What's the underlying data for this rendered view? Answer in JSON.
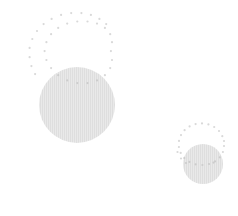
{
  "figure": {
    "width": 238,
    "height": 216,
    "background_color": "#ffffff"
  },
  "style": {
    "dot_color": "#d9d9d9",
    "dot_color_overlap": "#cccccc",
    "disc_fill_color": "#e6e6e6",
    "disc_hatch_color": "#dcdcdc",
    "dot_radius": 1.1,
    "hatch_spacing": 2,
    "hatch_width": 1
  },
  "chart_data": {
    "type": "scatter",
    "subtitle": "",
    "xlabel": "",
    "ylabel": "",
    "xlim": [
      0,
      238
    ],
    "ylim": [
      0,
      216
    ],
    "grid": false,
    "legend": "none",
    "axes_visible": false,
    "ticks_visible": false,
    "annotations": [],
    "series": [
      {
        "name": "large-dotted-ring",
        "shape": "circle-outline-dots",
        "marker": "dot",
        "center": [
          65,
          60
        ],
        "radius": 47,
        "point_count": 36,
        "color": "#d9d9d9",
        "points": [
          [
            112.0,
            60.0
          ],
          [
            110.2,
            68.1
          ],
          [
            104.9,
            75.2
          ],
          [
            97.0,
            80.4
          ],
          [
            87.5,
            83.1
          ],
          [
            77.3,
            83.1
          ],
          [
            67.2,
            80.4
          ],
          [
            58.2,
            75.2
          ],
          [
            51.1,
            68.1
          ],
          [
            46.4,
            60.0
          ],
          [
            44.6,
            51.1
          ],
          [
            46.4,
            42.2
          ],
          [
            51.1,
            34.2
          ],
          [
            58.2,
            27.9
          ],
          [
            67.2,
            23.6
          ],
          [
            77.3,
            21.5
          ],
          [
            87.5,
            21.5
          ],
          [
            97.0,
            23.6
          ],
          [
            104.9,
            27.9
          ],
          [
            110.2,
            34.2
          ],
          [
            112.0,
            42.2
          ],
          [
            110.9,
            51.1
          ],
          [
            106.2,
            24.1
          ],
          [
            99.4,
            18.9
          ],
          [
            90.9,
            14.9
          ],
          [
            81.4,
            13.1
          ],
          [
            71.2,
            13.1
          ],
          [
            61.1,
            14.9
          ],
          [
            51.6,
            18.9
          ],
          [
            43.6,
            24.1
          ],
          [
            37.0,
            31.0
          ],
          [
            32.3,
            39.0
          ],
          [
            29.6,
            47.9
          ],
          [
            29.6,
            57.2
          ],
          [
            31.4,
            66.1
          ],
          [
            35.1,
            74.1
          ]
        ]
      },
      {
        "name": "large-filled-disc",
        "shape": "circle-filled",
        "center": [
          77,
          105
        ],
        "radius": 38,
        "fill": "#e6e6e6",
        "hatch": "vertical"
      },
      {
        "name": "small-dotted-ring",
        "shape": "circle-outline-dots",
        "marker": "dot",
        "center": [
          199,
          146
        ],
        "radius": 25,
        "point_count": 26,
        "color": "#d9d9d9",
        "points": [
          [
            224.0,
            146.0
          ],
          [
            222.9,
            152.0
          ],
          [
            219.8,
            157.3
          ],
          [
            215.0,
            161.4
          ],
          [
            209.0,
            164.0
          ],
          [
            202.4,
            165.0
          ],
          [
            195.6,
            164.3
          ],
          [
            189.4,
            161.9
          ],
          [
            184.3,
            158.0
          ],
          [
            180.7,
            152.9
          ],
          [
            178.9,
            147.0
          ],
          [
            179.0,
            140.9
          ],
          [
            181.0,
            135.1
          ],
          [
            184.6,
            130.2
          ],
          [
            189.6,
            126.4
          ],
          [
            195.6,
            124.1
          ],
          [
            202.0,
            123.4
          ],
          [
            208.4,
            124.4
          ],
          [
            214.2,
            127.0
          ],
          [
            219.0,
            131.0
          ],
          [
            222.3,
            136.2
          ],
          [
            224.0,
            141.0
          ],
          [
            186.0,
            163.0
          ],
          [
            213.5,
            162.6
          ],
          [
            177.5,
            152.0
          ],
          [
            181.0,
            158.5
          ]
        ]
      },
      {
        "name": "small-filled-disc",
        "shape": "circle-filled",
        "center": [
          203,
          164
        ],
        "radius": 20,
        "fill": "#e6e6e6",
        "hatch": "vertical"
      }
    ]
  }
}
